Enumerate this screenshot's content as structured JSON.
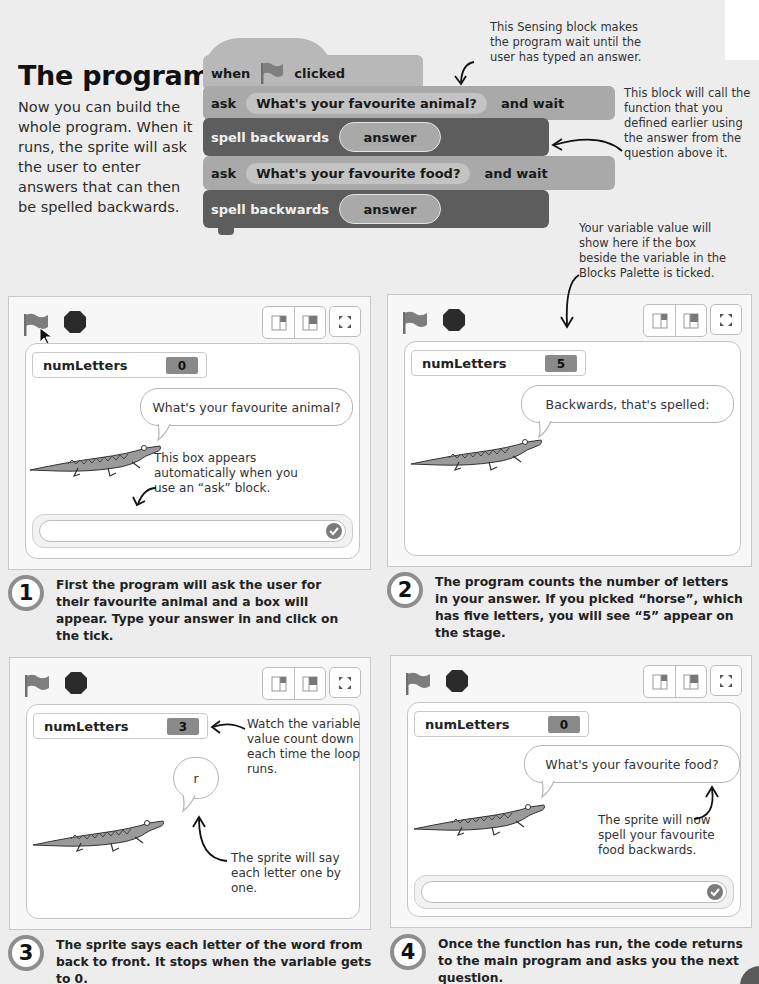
{
  "page": {
    "title": "The program",
    "intro": "Now you can build the whole program. When it runs, the sprite will ask the user to enter answers that can then be spelled backwards."
  },
  "code_blocks": {
    "hat": {
      "when": "when",
      "icon": "green-flag-icon",
      "clicked": "clicked"
    },
    "ask1": {
      "keyword": "ask",
      "question": "What's your favourite animal?",
      "suffix": "and wait"
    },
    "spell1": {
      "label": "spell backwards",
      "arg": "answer"
    },
    "ask2": {
      "keyword": "ask",
      "question": "What's your favourite food?",
      "suffix": "and wait"
    },
    "spell2": {
      "label": "spell backwards",
      "arg": "answer"
    }
  },
  "annotations": {
    "sensing_block": "This Sensing block makes the program wait until the user has typed an answer.",
    "function_call": "This block will call the function that you defined earlier using the answer from the question above it.",
    "variable_value": "Your variable value will show here if the box beside the variable in the Blocks Palette is ticked.",
    "ask_box": "This box appears automatically when you use an “ask” block.",
    "count_down": "Watch the variable value count down each time the loop runs.",
    "say_letter": "The sprite will say each letter one by one.",
    "spell_food": "The sprite will now spell your favourite food backwards."
  },
  "panels": [
    {
      "variable_name": "numLetters",
      "variable_value": "0",
      "bubble": "What's your favourite animal?",
      "has_ask_box": true,
      "step_number": "1",
      "caption": "First the program will ask the user for their favourite animal and a box will appear. Type your answer in and click on the tick."
    },
    {
      "variable_name": "numLetters",
      "variable_value": "5",
      "bubble": "Backwards, that's spelled:",
      "has_ask_box": false,
      "step_number": "2",
      "caption": "The program counts the number of letters in your answer. If you picked “horse”, which has five letters, you will see “5” appear on the stage."
    },
    {
      "variable_name": "numLetters",
      "variable_value": "3",
      "bubble": "r",
      "has_ask_box": false,
      "step_number": "3",
      "caption": "The sprite says each letter of the word from back to front. It stops when the variable gets to 0."
    },
    {
      "variable_name": "numLetters",
      "variable_value": "0",
      "bubble": "What's your favourite food?",
      "has_ask_box": true,
      "step_number": "4",
      "caption": "Once the function has run, the code returns to the main program and asks you the next question."
    }
  ],
  "colors": {
    "background": "#ededed",
    "event_block": "#b8b8b8",
    "sensing_block": "#a9a9a9",
    "custom_block": "#5d5d5d",
    "variable_value_bg": "#8a8a8a",
    "flag": "#7d7d7d",
    "stop": "#2b2b2b"
  }
}
